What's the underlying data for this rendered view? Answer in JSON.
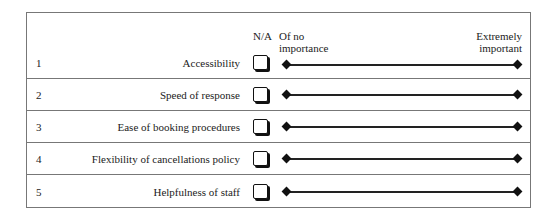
{
  "header": {
    "na_label": "N/A",
    "low_label_line1": "Of no",
    "low_label_line2": "importance",
    "high_label_line1": "Extremely",
    "high_label_line2": "important"
  },
  "rows": [
    {
      "number": "1",
      "label": "Accessibility"
    },
    {
      "number": "2",
      "label": "Speed of response"
    },
    {
      "number": "3",
      "label": "Ease of booking procedures"
    },
    {
      "number": "4",
      "label": "Flexibility of cancellations policy"
    },
    {
      "number": "5",
      "label": "Helpfulness of staff"
    }
  ],
  "icons": {
    "checkbox": "checkbox-icon",
    "scale_endpoint": "diamond-icon"
  }
}
